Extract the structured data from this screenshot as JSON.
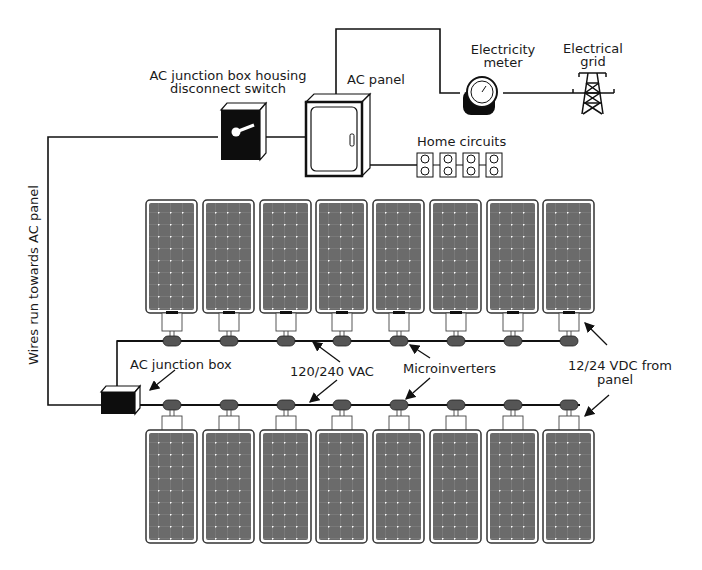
{
  "labels": {
    "disconnect_line1": "AC junction box housing",
    "disconnect_line2": "disconnect switch",
    "ac_panel": "AC panel",
    "meter_line1": "Electricity",
    "meter_line2": "meter",
    "grid_line1": "Electrical",
    "grid_line2": "grid",
    "home_circuits": "Home circuits",
    "wires_run": "Wires run towards AC panel",
    "ac_junction_box": "AC junction box",
    "vac": "120/240 VAC",
    "microinverters": "Microinverters",
    "vdc_line1": "12/24 VDC from",
    "vdc_line2": "panel"
  },
  "panels": {
    "top_row_count": 8,
    "bottom_row_count": 8
  },
  "colors": {
    "panel_fill": "#6b6b6b",
    "panel_border": "#333333",
    "cell_dot": "#ffffff",
    "microinverter": "#555555",
    "wire": "#111111",
    "box_black": "#0d0d0d"
  }
}
